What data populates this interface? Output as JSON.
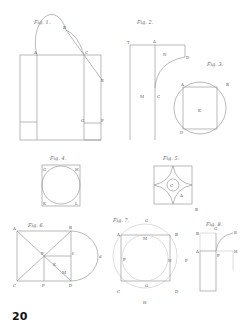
{
  "plate": {
    "page_number": "20",
    "figures": [
      {
        "id": "fig1",
        "title": "Fig. 1.",
        "labels": [
          "A",
          "B",
          "C",
          "D",
          "E",
          "F",
          "G",
          "H",
          "K",
          "L"
        ]
      },
      {
        "id": "fig2",
        "title": "Fig. 2.",
        "labels": [
          "T",
          "A",
          "N",
          "D",
          "M",
          "C",
          "B"
        ]
      },
      {
        "id": "fig3",
        "title": "Fig. 3.",
        "labels": [
          "A",
          "B",
          "K",
          "D",
          "C"
        ]
      },
      {
        "id": "fig4",
        "title": "Fig. 4.",
        "labels": [
          "G",
          "H",
          "K",
          "L"
        ]
      },
      {
        "id": "fig5",
        "title": "Fig. 5.",
        "labels": [
          "C",
          "A",
          "B"
        ]
      },
      {
        "id": "fig6",
        "title": "Fig. 6.",
        "labels": [
          "A",
          "B",
          "F",
          "f",
          "K",
          "M",
          "C",
          "F",
          "D",
          "d"
        ]
      },
      {
        "id": "fig7",
        "title": "Fig. 7.",
        "labels": [
          "G",
          "A",
          "M",
          "B",
          "P",
          "N",
          "F",
          "C",
          "O",
          "D",
          "H"
        ]
      },
      {
        "id": "fig8",
        "title": "Fig. 8.",
        "labels": [
          "B",
          "G",
          "E",
          "A",
          "F",
          "H",
          "B"
        ]
      }
    ]
  }
}
